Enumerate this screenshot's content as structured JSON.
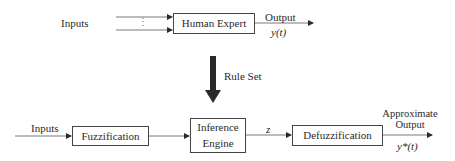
{
  "top_system": {
    "inputs_label": "Inputs",
    "input_ellipsis": "⋮",
    "box_label": "Human Expert",
    "output_label": "Output",
    "output_symbol": "y(t)"
  },
  "transfer": {
    "label": "Rule Set"
  },
  "bottom_system": {
    "inputs_label": "Inputs",
    "fuzzification_label": "Fuzzification",
    "inference_line1": "Inference",
    "inference_line2": "Engine",
    "intermediate_symbol": "z",
    "defuzzification_label": "Defuzzification",
    "output_line1": "Approximate",
    "output_line2": "Output",
    "output_symbol": "y*(t)"
  },
  "colors": {
    "line": "#444444",
    "arrow_fill": "#2a2a2a",
    "text": "#2a2a2a"
  }
}
